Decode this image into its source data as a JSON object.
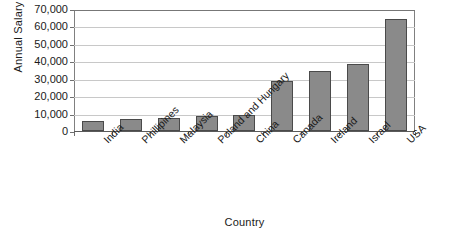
{
  "chart_data": {
    "type": "bar",
    "title": "",
    "xlabel": "Country",
    "ylabel": "Annual Salary",
    "categories": [
      "India",
      "Phillipines",
      "Malaysia",
      "Poland and Hungary",
      "China",
      "Canada",
      "Ireland",
      "Israel",
      "USA"
    ],
    "values": [
      6000,
      6800,
      7400,
      8700,
      9300,
      28500,
      34500,
      38300,
      64000
    ],
    "ylim": [
      0,
      70000
    ],
    "ytick_values": [
      0,
      10000,
      20000,
      30000,
      40000,
      50000,
      60000,
      70000
    ],
    "ytick_labels": [
      "0",
      "10,000",
      "20,000",
      "30,000",
      "40,000",
      "50,000",
      "60,000",
      "70,000"
    ],
    "grid": true,
    "legend": null,
    "bar_color": "#8a8a8a",
    "bar_border_color": "#4a4a4a",
    "gridline_color": "#c8c8c8",
    "axis_color": "#707070",
    "background_color": "#ffffff"
  }
}
